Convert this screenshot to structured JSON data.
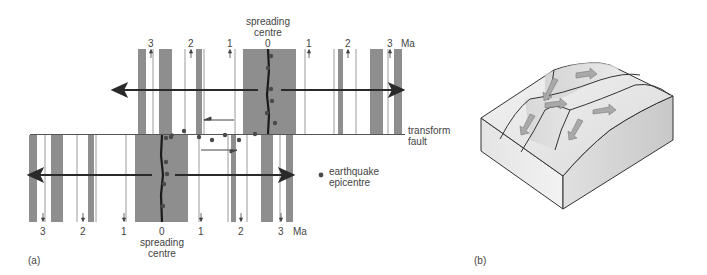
{
  "figure": {
    "panel_a_label": "(a)",
    "panel_b_label": "(b)"
  },
  "panel_a": {
    "top_ridge": {
      "title_line1": "spreading",
      "title_line2": "centre",
      "ages_left": [
        "3",
        "2",
        "1"
      ],
      "age_center": "0",
      "ages_right": [
        "1",
        "2",
        "3"
      ],
      "unit": "Ma"
    },
    "bottom_ridge": {
      "title_line1": "spreading",
      "title_line2": "centre",
      "ages_left": [
        "3",
        "2",
        "1"
      ],
      "age_center": "0",
      "ages_right": [
        "1",
        "2",
        "3"
      ],
      "unit": "Ma"
    },
    "transform_fault_line1": "transform",
    "transform_fault_line2": "fault",
    "legend_line1": "earthquake",
    "legend_line2": "epicentre",
    "colors": {
      "anomaly_band": "#8c8c8c",
      "ridge_axis": "#1a1a1a",
      "epicentre": "#4a4a4a",
      "arrow": "#2a2a2a"
    }
  },
  "panel_b": {
    "description": "3D block diagram of offset spreading ridge and transform fault with motion arrows",
    "colors": {
      "block_top": "#e6e6e6",
      "block_side": "#d2d2d2",
      "arrow_fill": "#a8a8a8"
    }
  }
}
